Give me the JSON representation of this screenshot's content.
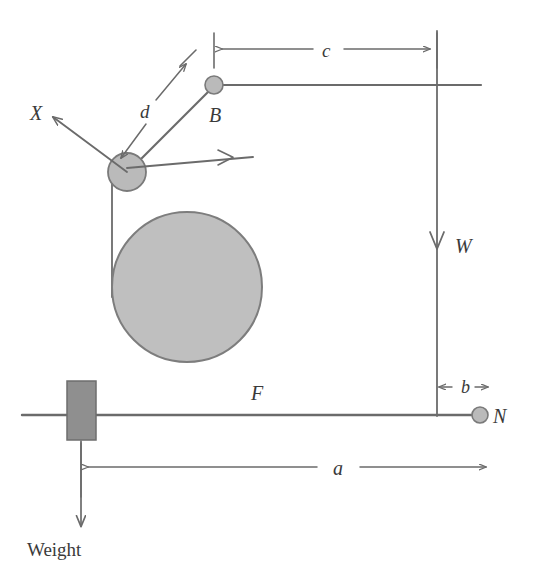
{
  "diagram": {
    "colors": {
      "line": "#6b6b6b",
      "line_dark": "#555555",
      "text": "#3a3a3a",
      "node_fill": "#b8b8b8",
      "node_stroke": "#7a7a7a",
      "drum_fill": "#bfbfbf",
      "drum_stroke": "#7d7d7d",
      "weight_fill": "#8f8f8f",
      "weight_stroke": "#6e6e6e",
      "background": "#ffffff"
    },
    "nodes": [
      {
        "id": "B",
        "label": "B",
        "x": 214,
        "y": 85,
        "r": 9,
        "style": "italic"
      },
      {
        "id": "N",
        "label": "N",
        "x": 480,
        "y": 415,
        "r": 8,
        "style": "italic"
      },
      {
        "id": "joint",
        "label": "",
        "x": 127,
        "y": 172,
        "r": 19,
        "style": "plain"
      }
    ],
    "labels": [
      {
        "id": "X",
        "text": "X",
        "x": 30,
        "y": 113,
        "style": "italic",
        "size": 19
      },
      {
        "id": "B",
        "text": "B",
        "x": 215,
        "y": 118,
        "style": "italic",
        "size": 19
      },
      {
        "id": "N",
        "text": "N",
        "x": 492,
        "y": 422,
        "style": "italic",
        "size": 19
      },
      {
        "id": "W",
        "text": "W",
        "x": 460,
        "y": 253,
        "style": "italic",
        "size": 19
      },
      {
        "id": "F",
        "text": "F",
        "x": 255,
        "y": 396,
        "style": "italic",
        "size": 19
      },
      {
        "id": "c",
        "text": "c",
        "x": 327,
        "y": 55,
        "style": "italic",
        "size": 18
      },
      {
        "id": "d",
        "text": "d",
        "x": 146,
        "y": 112,
        "style": "italic",
        "size": 18
      },
      {
        "id": "b",
        "text": "b",
        "x": 468,
        "y": 393,
        "style": "italic",
        "size": 17
      },
      {
        "id": "a",
        "text": "a",
        "x": 345,
        "y": 474,
        "style": "italic",
        "size": 19
      },
      {
        "id": "Weight",
        "text": "Weight",
        "x": 29,
        "y": 551,
        "style": "plain",
        "size": 18
      }
    ],
    "dimensions": [
      {
        "id": "c",
        "label": "c",
        "orientation": "horizontal",
        "x1": 214,
        "x2": 437,
        "y": 48
      },
      {
        "id": "d",
        "label": "d",
        "orientation": "diagonal",
        "x1": 127,
        "y1": 172,
        "x2": 189,
        "y2": 56
      },
      {
        "id": "b",
        "label": "b",
        "orientation": "horizontal",
        "x1": 437,
        "x2": 480,
        "y": 387
      },
      {
        "id": "a",
        "label": "a",
        "orientation": "horizontal",
        "x1": 81,
        "x2": 487,
        "y": 467
      }
    ],
    "forces": [
      {
        "id": "X",
        "label": "X",
        "from_x": 127,
        "from_y": 172,
        "to_x": 55,
        "to_y": 118
      },
      {
        "id": "horizontal-joint",
        "label": "",
        "from_x": 127,
        "from_y": 172,
        "to_x": 253,
        "to_y": 156
      },
      {
        "id": "W",
        "label": "W",
        "from_x": 437,
        "from_y": 85,
        "to_x": 437,
        "to_y": 260
      },
      {
        "id": "Weight",
        "label": "Weight",
        "from_x": 81,
        "from_y": 440,
        "to_x": 81,
        "to_y": 528
      }
    ],
    "members": [
      {
        "id": "top-beam",
        "x1": 214,
        "y1": 85,
        "x2": 480,
        "y2": 85
      },
      {
        "id": "strut-joint-to-B",
        "x1": 127,
        "y1": 172,
        "x2": 214,
        "y2": 85
      },
      {
        "id": "vertical-rope",
        "x1": 112,
        "y1": 178,
        "x2": 112,
        "y2": 295
      },
      {
        "id": "right-vertical",
        "x1": 437,
        "y1": 30,
        "x2": 437,
        "y2": 415
      },
      {
        "id": "bottom-beam",
        "x1": 22,
        "y1": 415,
        "x2": 480,
        "y2": 415
      }
    ],
    "shapes": [
      {
        "id": "drum",
        "type": "circle",
        "cx": 187,
        "cy": 287,
        "r": 75
      },
      {
        "id": "weight-block",
        "type": "rect",
        "x": 67,
        "y": 381,
        "width": 29,
        "height": 59
      }
    ]
  }
}
